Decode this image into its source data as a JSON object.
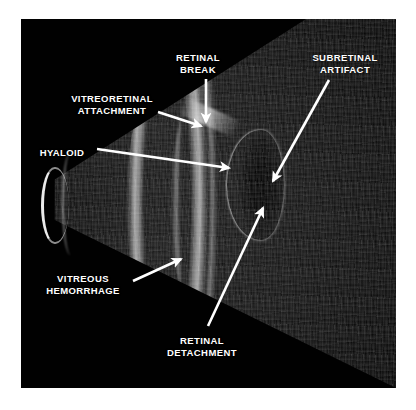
{
  "figure": {
    "kind": "ocular-b-scan-ultrasound",
    "background_color": "#ffffff",
    "frame_color": "#010101",
    "annotation_color": "#ffffff"
  },
  "annotations": [
    {
      "id": "retinal-break",
      "label": "RETINAL\nBREAK",
      "label_x": 198,
      "label_y": 52,
      "align": "center",
      "arrow": {
        "x1": 206,
        "y1": 79,
        "x2": 206,
        "y2": 122
      }
    },
    {
      "id": "subretinal-artifact",
      "label": "SUBRETINAL\nARTIFACT",
      "label_x": 345,
      "label_y": 52,
      "align": "center",
      "arrow": {
        "x1": 329,
        "y1": 80,
        "x2": 273,
        "y2": 181
      }
    },
    {
      "id": "vitreoretinal-attachment",
      "label": "VITREORETINAL\nATTACHMENT",
      "label_x": 112,
      "label_y": 93,
      "align": "center",
      "arrow": {
        "x1": 158,
        "y1": 112,
        "x2": 201,
        "y2": 126
      }
    },
    {
      "id": "hyaloid",
      "label": "HYALOID",
      "label_x": 62,
      "label_y": 147,
      "align": "center",
      "arrow": {
        "x1": 97,
        "y1": 149,
        "x2": 229,
        "y2": 168
      }
    },
    {
      "id": "vitreous-hemorrhage",
      "label": "VITREOUS\nHEMORRHAGE",
      "label_x": 83,
      "label_y": 273,
      "align": "center",
      "arrow": {
        "x1": 133,
        "y1": 281,
        "x2": 181,
        "y2": 259
      }
    },
    {
      "id": "retinal-detachment",
      "label": "RETINAL\nDETACHMENT",
      "label_x": 202,
      "label_y": 335,
      "align": "center",
      "arrow": {
        "x1": 208,
        "y1": 326,
        "x2": 263,
        "y2": 208
      }
    }
  ]
}
